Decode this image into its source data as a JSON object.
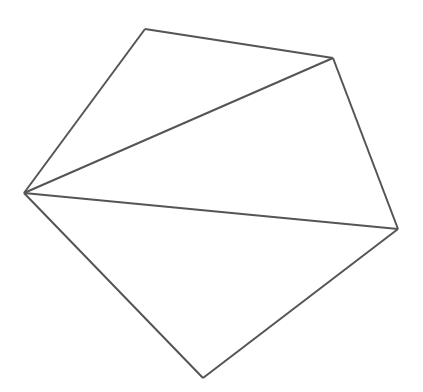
{
  "diagram": {
    "type": "pentagon-triangulated",
    "stroke_color": "#555555",
    "background": "#ffffff",
    "vertices": {
      "A": [
        145,
        29
      ],
      "B": [
        333,
        58
      ],
      "C": [
        398,
        229
      ],
      "D": [
        203,
        378
      ],
      "E": [
        24,
        193
      ]
    },
    "edges": [
      [
        "A",
        "B"
      ],
      [
        "B",
        "C"
      ],
      [
        "C",
        "D"
      ],
      [
        "D",
        "E"
      ],
      [
        "E",
        "A"
      ]
    ],
    "diagonals": [
      [
        "E",
        "B"
      ],
      [
        "E",
        "C"
      ]
    ]
  }
}
